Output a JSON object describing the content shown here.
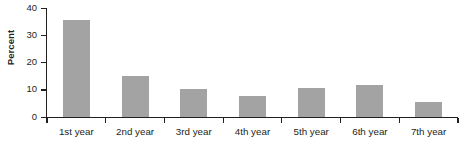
{
  "chart_data": {
    "type": "bar",
    "title": "",
    "subtitle": "",
    "xlabel": "",
    "ylabel": "Percent",
    "categories": [
      "1st year",
      "2nd year",
      "3rd year",
      "4th year",
      "5th year",
      "6th year",
      "7th year"
    ],
    "values": [
      35.5,
      15.0,
      10.0,
      7.5,
      10.5,
      11.5,
      5.5
    ],
    "series": [
      {
        "name": "Percent",
        "values": [
          35.5,
          15.0,
          10.0,
          7.5,
          10.5,
          11.5,
          5.5
        ]
      }
    ],
    "ylim": [
      0,
      40
    ],
    "xlim": [
      0,
      7
    ],
    "yticks": [
      0,
      10,
      20,
      30,
      40
    ],
    "ytick_labels": [
      "0",
      "10",
      "20",
      "30",
      "40"
    ],
    "grid": false,
    "legend": false,
    "legend_position": "none",
    "bar_color": "#a3a3a3",
    "axis_color": "#231f20",
    "background": "#ffffff"
  }
}
